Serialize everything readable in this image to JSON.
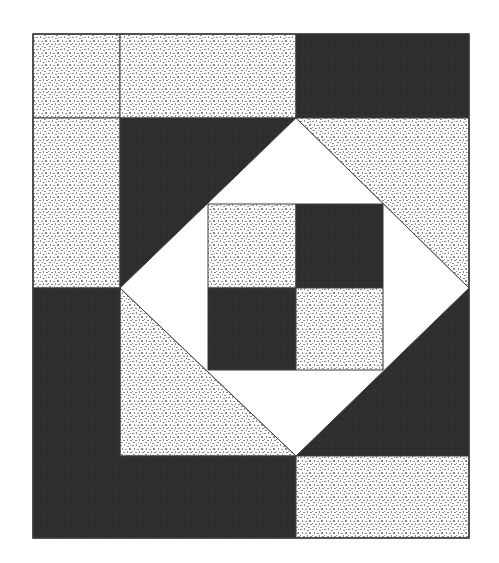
{
  "diagram": {
    "type": "quilt-block",
    "canvas": {
      "width": 499,
      "height": 563,
      "background": "#ffffff"
    },
    "colors": {
      "dark": "#2e2e2e",
      "speckle_bg": "#ffffff",
      "speckle_dot": "#8a8a8a",
      "plain": "#ffffff",
      "outline": "#3a3a3a"
    },
    "outer_frame": {
      "x1": 33,
      "y1": 34,
      "x2": 469,
      "y2": 538
    },
    "pieces": [
      {
        "name": "top-left-small-square",
        "fill": "speckle",
        "points": [
          [
            33,
            34
          ],
          [
            120,
            34
          ],
          [
            120,
            118
          ],
          [
            33,
            118
          ]
        ]
      },
      {
        "name": "top-center-rectangle",
        "fill": "speckle",
        "points": [
          [
            120,
            34
          ],
          [
            296,
            34
          ],
          [
            296,
            118
          ],
          [
            120,
            118
          ]
        ]
      },
      {
        "name": "top-right-rectangle",
        "fill": "dark",
        "points": [
          [
            296,
            34
          ],
          [
            469,
            34
          ],
          [
            469,
            118
          ],
          [
            296,
            118
          ]
        ]
      },
      {
        "name": "left-upper-rectangle",
        "fill": "speckle",
        "points": [
          [
            33,
            118
          ],
          [
            120,
            118
          ],
          [
            120,
            288
          ],
          [
            33,
            288
          ]
        ]
      },
      {
        "name": "upper-left-dark-triangle",
        "fill": "dark",
        "points": [
          [
            120,
            118
          ],
          [
            296,
            118
          ],
          [
            120,
            288
          ]
        ]
      },
      {
        "name": "upper-right-speckle-triangle",
        "fill": "speckle",
        "points": [
          [
            296,
            118
          ],
          [
            469,
            118
          ],
          [
            469,
            288
          ]
        ]
      },
      {
        "name": "lower-right-dark-triangle",
        "fill": "dark",
        "points": [
          [
            469,
            288
          ],
          [
            469,
            456
          ],
          [
            296,
            456
          ]
        ]
      },
      {
        "name": "lower-left-speckle-triangle",
        "fill": "speckle",
        "points": [
          [
            120,
            288
          ],
          [
            296,
            456
          ],
          [
            120,
            456
          ]
        ]
      },
      {
        "name": "bottom-left-dark-l",
        "fill": "dark",
        "points": [
          [
            33,
            288
          ],
          [
            120,
            288
          ],
          [
            120,
            456
          ],
          [
            296,
            456
          ],
          [
            296,
            538
          ],
          [
            33,
            538
          ]
        ]
      },
      {
        "name": "bottom-right-rectangle",
        "fill": "speckle",
        "points": [
          [
            296,
            456
          ],
          [
            469,
            456
          ],
          [
            469,
            538
          ],
          [
            296,
            538
          ]
        ]
      },
      {
        "name": "center-diamond",
        "fill": "plain",
        "points": [
          [
            296,
            118
          ],
          [
            469,
            288
          ],
          [
            296,
            456
          ],
          [
            120,
            288
          ]
        ]
      },
      {
        "name": "nine-patch-top-left",
        "fill": "speckle",
        "points": [
          [
            208,
            204
          ],
          [
            296,
            204
          ],
          [
            296,
            288
          ],
          [
            208,
            288
          ]
        ]
      },
      {
        "name": "nine-patch-top-right",
        "fill": "dark",
        "points": [
          [
            296,
            204
          ],
          [
            383,
            204
          ],
          [
            383,
            288
          ],
          [
            296,
            288
          ]
        ]
      },
      {
        "name": "nine-patch-bottom-left",
        "fill": "dark",
        "points": [
          [
            208,
            288
          ],
          [
            296,
            288
          ],
          [
            296,
            370
          ],
          [
            208,
            370
          ]
        ]
      },
      {
        "name": "nine-patch-bottom-right",
        "fill": "speckle",
        "points": [
          [
            296,
            288
          ],
          [
            383,
            288
          ],
          [
            383,
            370
          ],
          [
            296,
            370
          ]
        ]
      }
    ]
  }
}
